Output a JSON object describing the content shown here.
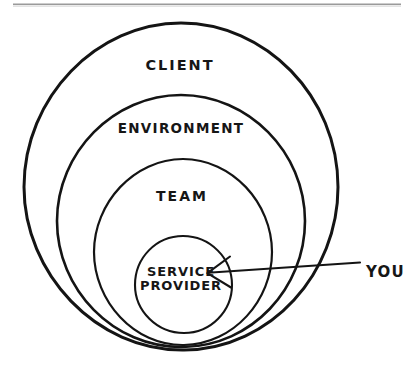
{
  "diagram": {
    "type": "concentric-circles",
    "title_text": "",
    "background_color": "#ffffff",
    "ink_color": "#141414",
    "scan_artifact_color": "#9a9a9a",
    "rings": [
      {
        "id": "client",
        "label": "CLIENT",
        "level": 1,
        "position": "outermost",
        "label_x": 180,
        "label_y": 66,
        "cx": 181,
        "cy": 187,
        "rx": 157,
        "ry": 164
      },
      {
        "id": "environment",
        "label": "ENVIRONMENT",
        "level": 2,
        "position": "second",
        "label_x": 181,
        "label_y": 128,
        "cx": 181,
        "cy": 221,
        "rx": 124,
        "ry": 126
      },
      {
        "id": "team",
        "label": "TEAM",
        "level": 3,
        "position": "third",
        "label_x": 182,
        "label_y": 197,
        "cx": 183,
        "cy": 252,
        "rx": 89,
        "ry": 93
      },
      {
        "id": "service-provider",
        "label": "SERVICE\nPROVIDER",
        "label_line_1": "SERVICE",
        "label_line_2": "PROVIDER",
        "level": 4,
        "position": "innermost",
        "label_x": 181,
        "label_y": 279,
        "cx": 183,
        "cy": 284,
        "rx": 48,
        "ry": 48
      }
    ],
    "annotation": {
      "label": "YOU",
      "label_x": 366,
      "label_y": 272,
      "arrow_tail_x": 360,
      "arrow_tail_y": 263,
      "arrow_tip_x": 207,
      "arrow_tip_y": 273,
      "points_to": "service-provider"
    },
    "scan_artifact": {
      "x_start": 13,
      "x_end": 401,
      "y": 4
    }
  }
}
